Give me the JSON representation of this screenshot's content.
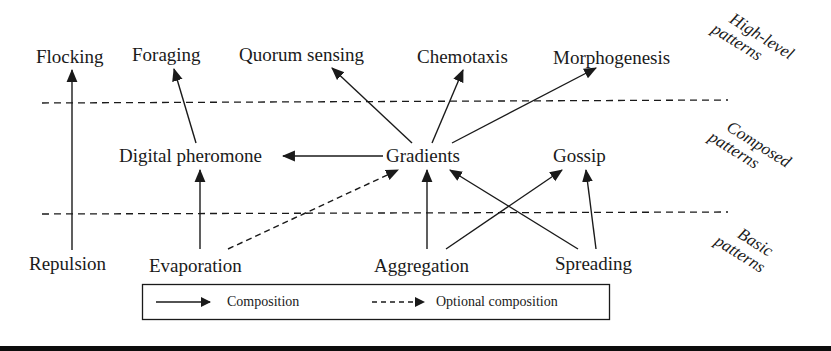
{
  "diagram": {
    "tiers": [
      {
        "id": "high",
        "label_line1": "High-level",
        "label_line2": "patterns"
      },
      {
        "id": "composed",
        "label_line1": "Composed",
        "label_line2": "patterns"
      },
      {
        "id": "basic",
        "label_line1": "Basic",
        "label_line2": "patterns"
      }
    ],
    "nodes": {
      "flocking": "Flocking",
      "foraging": "Foraging",
      "quorum_sensing": "Quorum sensing",
      "chemotaxis": "Chemotaxis",
      "morphogenesis": "Morphogenesis",
      "digital_pheromone": "Digital pheromone",
      "gradients": "Gradients",
      "gossip": "Gossip",
      "repulsion": "Repulsion",
      "evaporation": "Evaporation",
      "aggregation": "Aggregation",
      "spreading": "Spreading"
    },
    "edges": [
      {
        "from": "Repulsion",
        "to": "Flocking",
        "type": "composition"
      },
      {
        "from": "Digital pheromone",
        "to": "Foraging",
        "type": "composition"
      },
      {
        "from": "Gradients",
        "to": "Quorum sensing",
        "type": "composition"
      },
      {
        "from": "Gradients",
        "to": "Chemotaxis",
        "type": "composition"
      },
      {
        "from": "Gradients",
        "to": "Morphogenesis",
        "type": "composition"
      },
      {
        "from": "Gradients",
        "to": "Digital pheromone",
        "type": "composition"
      },
      {
        "from": "Evaporation",
        "to": "Digital pheromone",
        "type": "composition"
      },
      {
        "from": "Evaporation",
        "to": "Gradients",
        "type": "optional composition"
      },
      {
        "from": "Aggregation",
        "to": "Gradients",
        "type": "composition"
      },
      {
        "from": "Aggregation",
        "to": "Gossip",
        "type": "composition"
      },
      {
        "from": "Spreading",
        "to": "Gradients",
        "type": "composition"
      },
      {
        "from": "Spreading",
        "to": "Gossip",
        "type": "composition"
      }
    ],
    "legend": {
      "composition": "Composition",
      "optional_composition": "Optional composition"
    },
    "colors": {
      "ink": "#1a1a1a",
      "background": "#ffffff",
      "bottom_bar": "#0d0d0d"
    }
  }
}
